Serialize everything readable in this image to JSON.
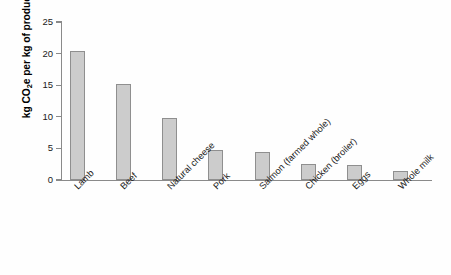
{
  "chart_data": {
    "type": "bar",
    "title": "",
    "xlabel": "",
    "ylabel": "kg CO2e per kg of product",
    "ylabel_parts": {
      "pre": "kg CO",
      "sub": "2",
      "post": "e per kg of product"
    },
    "ylim": [
      0,
      25
    ],
    "yticks": [
      0,
      5,
      10,
      15,
      20,
      25
    ],
    "ytick_labels": [
      "0",
      "5",
      "10",
      "15",
      "20",
      "25"
    ],
    "grid": false,
    "legend": null,
    "categories": [
      "Lamb",
      "Beef",
      "Natural cheese",
      "Pork",
      "Salmon (farmed whole)",
      "Chicken (broiler)",
      "Eggs",
      "Whole milk"
    ],
    "values": [
      20.4,
      15.2,
      9.8,
      4.8,
      4.4,
      2.6,
      2.3,
      1.4
    ],
    "bar_color": "#cccccc",
    "bar_edge_color": "#8f8f8f",
    "axis_color": "#8a8a8a",
    "background_color": "#ffffff"
  }
}
